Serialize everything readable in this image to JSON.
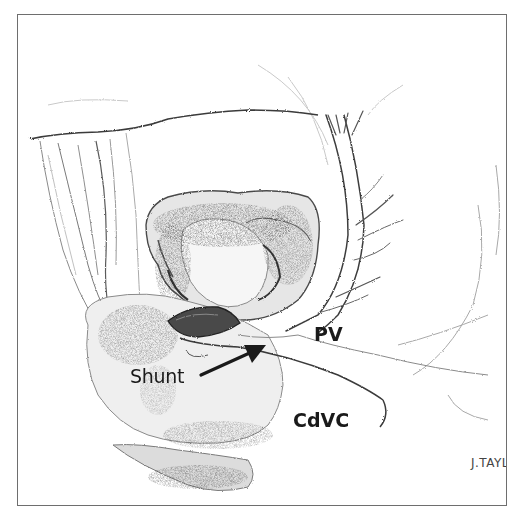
{
  "figure": {
    "border_color": "#6e6e6e",
    "ink_color": "#1a1a1a",
    "labels": {
      "pv": "PV",
      "cdvc": "CdVC",
      "shunt": "Shunt"
    },
    "arrow": {
      "from_label": "Shunt",
      "points_to": "shunt vessel between PV and CdVC"
    },
    "signature": "J.TAYL"
  }
}
